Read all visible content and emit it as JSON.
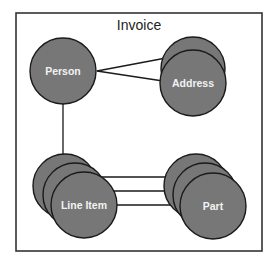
{
  "diagram": {
    "title": "Invoice",
    "colors": {
      "node_fill": "#777777",
      "node_stroke": "#1a1a1a",
      "label": "#f2f2f2",
      "frame": "#333333",
      "background": "#ffffff"
    },
    "nodes": [
      {
        "id": "person",
        "label": "Person",
        "stack_count": 1
      },
      {
        "id": "address",
        "label": "Address",
        "stack_count": 2
      },
      {
        "id": "line_item",
        "label": "Line Item",
        "stack_count": 3
      },
      {
        "id": "part",
        "label": "Part",
        "stack_count": 3
      }
    ],
    "edges": [
      {
        "from": "Person",
        "to": "Address",
        "style": "crow-foot many (2 lines)"
      },
      {
        "from": "Person",
        "to": "Line Item",
        "style": "single line"
      },
      {
        "from": "Line Item",
        "to": "Part",
        "style": "many-to-many (3 lines)"
      }
    ]
  }
}
